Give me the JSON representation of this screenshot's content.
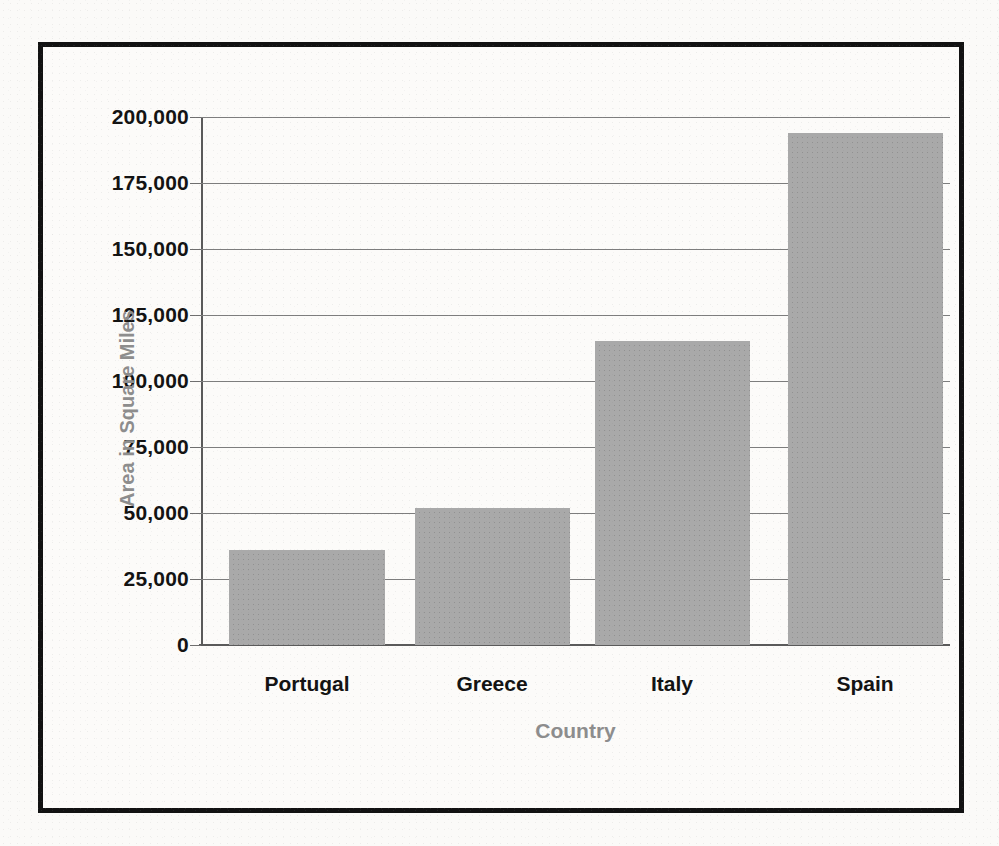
{
  "chart_data": {
    "type": "bar",
    "title": "",
    "xlabel": "Country",
    "ylabel": "Area in Square Miles",
    "categories": [
      "Portugal",
      "Greece",
      "Italy",
      "Spain"
    ],
    "values": [
      36000,
      52000,
      115000,
      194000
    ],
    "ylim": [
      0,
      200000
    ],
    "yticks": [
      0,
      25000,
      50000,
      75000,
      100000,
      125000,
      150000,
      175000,
      200000
    ],
    "ytick_labels": [
      "0",
      "25,000",
      "50,000",
      "75,000",
      "100,000",
      "125,000",
      "150,000",
      "175,000",
      "200,000"
    ],
    "grid": true,
    "legend": "none",
    "bar_color": "#a9a9a9",
    "axis_title_color": "#8d8d8d",
    "tick_label_color": "#131313",
    "gridline_color": "#7d7d7d",
    "frame_color": "#121212",
    "background_color": "#fbfaf8"
  }
}
